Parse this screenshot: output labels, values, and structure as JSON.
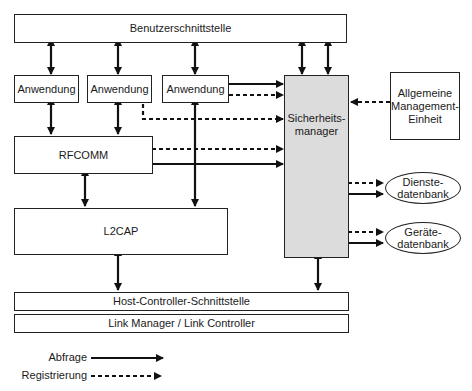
{
  "diagram": {
    "top_layer": "Benutzerschnittstelle",
    "applications": [
      "Anwendung",
      "Anwendung",
      "Anwendung"
    ],
    "rfcomm": "RFCOMM",
    "l2cap": "L2CAP",
    "security_manager": "Sicherheits-\nmanager",
    "general_management": "Allgemeine\nManagement-\nEinheit",
    "service_db": "Dienste-\ndatenbank",
    "device_db": "Geräte-\ndatenbank",
    "hci": "Host-Controller-Schnittstelle",
    "link_manager": "Link Manager / Link Controller"
  },
  "legend": {
    "query_label": "Abfrage",
    "registration_label": "Registrierung"
  },
  "colors": {
    "line": "#111111",
    "security_fill": "#dcdcdc"
  }
}
